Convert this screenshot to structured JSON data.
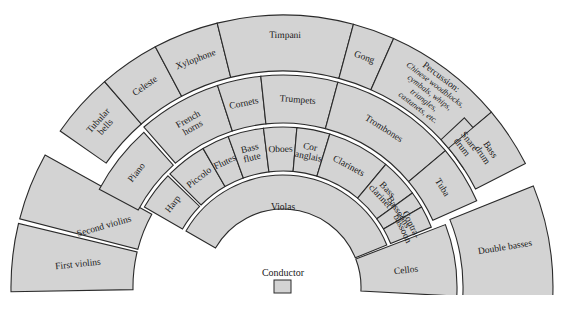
{
  "colors": {
    "section_fill": "#d3d3d3",
    "background": "#ffffff",
    "outline": "#2a2a2a"
  },
  "conductor": {
    "label": "Conductor"
  },
  "sections": [
    {
      "id": "first-violins",
      "group": "strings",
      "lines": [
        "First violins"
      ]
    },
    {
      "id": "second-violins",
      "group": "strings",
      "lines": [
        "Second violins"
      ]
    },
    {
      "id": "violas",
      "group": "strings",
      "lines": [
        "Violas"
      ]
    },
    {
      "id": "cellos",
      "group": "strings",
      "lines": [
        "Cellos"
      ]
    },
    {
      "id": "double-basses",
      "group": "strings",
      "lines": [
        "Double basses"
      ]
    },
    {
      "id": "harp",
      "group": "keyboard-harp",
      "lines": [
        "Harp"
      ]
    },
    {
      "id": "piano",
      "group": "keyboard-harp",
      "lines": [
        "Piano"
      ]
    },
    {
      "id": "piccolo",
      "group": "woodwinds",
      "lines": [
        "Piccolo"
      ]
    },
    {
      "id": "flutes",
      "group": "woodwinds",
      "lines": [
        "Flutes"
      ]
    },
    {
      "id": "bass-flute",
      "group": "woodwinds",
      "lines": [
        "Bass",
        "flute"
      ]
    },
    {
      "id": "oboes",
      "group": "woodwinds",
      "lines": [
        "Oboes"
      ]
    },
    {
      "id": "cor-anglais",
      "group": "woodwinds",
      "lines": [
        "Cor",
        "anglais"
      ]
    },
    {
      "id": "clarinets",
      "group": "woodwinds",
      "lines": [
        "Clarinets"
      ]
    },
    {
      "id": "bass-clarinet",
      "group": "woodwinds",
      "lines": [
        "Bass",
        "clarinet"
      ]
    },
    {
      "id": "bassoons",
      "group": "woodwinds",
      "lines": [
        "Bassoons"
      ]
    },
    {
      "id": "contrabassoon",
      "group": "woodwinds",
      "lines": [
        "Contra-",
        "bassoon"
      ]
    },
    {
      "id": "french-horns",
      "group": "brass",
      "lines": [
        "French",
        "horns"
      ]
    },
    {
      "id": "cornets",
      "group": "brass",
      "lines": [
        "Cornets"
      ]
    },
    {
      "id": "trumpets",
      "group": "brass",
      "lines": [
        "Trumpets"
      ]
    },
    {
      "id": "trombones",
      "group": "brass",
      "lines": [
        "Trombones"
      ]
    },
    {
      "id": "tuba",
      "group": "brass",
      "lines": [
        "Tuba"
      ]
    },
    {
      "id": "tubular-bells",
      "group": "percussion",
      "lines": [
        "Tubular",
        "bells"
      ]
    },
    {
      "id": "celeste",
      "group": "percussion",
      "lines": [
        "Celeste"
      ]
    },
    {
      "id": "xylophone",
      "group": "percussion",
      "lines": [
        "Xylophone"
      ]
    },
    {
      "id": "timpani",
      "group": "percussion",
      "lines": [
        "Timpani"
      ]
    },
    {
      "id": "gong",
      "group": "percussion",
      "lines": [
        "Gong"
      ]
    },
    {
      "id": "percussion",
      "group": "percussion",
      "lines": [
        "Percussion:"
      ],
      "italic_lines": [
        "Chinese woodblocks,",
        "cymbals, whips,",
        "triangles,",
        "castanets, etc."
      ]
    },
    {
      "id": "snare-drum",
      "group": "percussion",
      "lines": [
        "Snare",
        "drum"
      ]
    },
    {
      "id": "bass-drum",
      "group": "percussion",
      "lines": [
        "Bass",
        "drum"
      ]
    }
  ]
}
